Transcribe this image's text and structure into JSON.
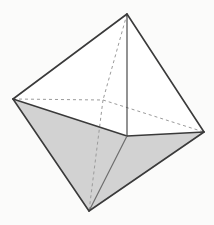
{
  "figure": {
    "name": "octahedron",
    "background_color": "#fbfbfa",
    "edge_color": "#3a3a3a",
    "hidden_edge_color": "#9b9b9b",
    "shaded_face_color": "#d2d2d2",
    "unshaded_face_color": "#ffffff",
    "edge_width": 1.6,
    "hidden_edge_width": 1.0,
    "hidden_edge_dash": "3 3",
    "vertices": {
      "top": {
        "label": "top apex",
        "x": 127,
        "y": 14
      },
      "left": {
        "label": "left vertex",
        "x": 13,
        "y": 99
      },
      "back": {
        "label": "back vertex",
        "x": 103,
        "y": 100
      },
      "right": {
        "label": "right vertex",
        "x": 204,
        "y": 132
      },
      "front": {
        "label": "front vertex",
        "x": 127,
        "y": 136
      },
      "bottom": {
        "label": "bottom apex",
        "x": 89,
        "y": 211
      }
    },
    "faces": [
      {
        "name": "upper-left-front",
        "vertices": [
          "top",
          "left",
          "front"
        ],
        "fill": "#ffffff",
        "visible": true
      },
      {
        "name": "upper-right-front",
        "vertices": [
          "top",
          "front",
          "right"
        ],
        "fill": "#ffffff",
        "visible": true
      },
      {
        "name": "upper-left-back",
        "vertices": [
          "top",
          "left",
          "back"
        ],
        "fill": "#ffffff",
        "visible": false
      },
      {
        "name": "upper-right-back",
        "vertices": [
          "top",
          "back",
          "right"
        ],
        "fill": "#ffffff",
        "visible": false
      },
      {
        "name": "lower-left-front",
        "vertices": [
          "bottom",
          "left",
          "front"
        ],
        "fill": "#d2d2d2",
        "visible": true
      },
      {
        "name": "lower-right-front",
        "vertices": [
          "bottom",
          "front",
          "right"
        ],
        "fill": "#d2d2d2",
        "visible": true
      },
      {
        "name": "lower-left-back",
        "vertices": [
          "bottom",
          "left",
          "back"
        ],
        "fill": "#d2d2d2",
        "visible": false
      },
      {
        "name": "lower-right-back",
        "vertices": [
          "bottom",
          "back",
          "right"
        ],
        "fill": "#d2d2d2",
        "visible": false
      }
    ],
    "visible_edges": [
      {
        "name": "edge-top-left",
        "from": "top",
        "to": "left"
      },
      {
        "name": "edge-top-front",
        "from": "top",
        "to": "front"
      },
      {
        "name": "edge-top-right",
        "from": "top",
        "to": "right"
      },
      {
        "name": "edge-left-front",
        "from": "left",
        "to": "front"
      },
      {
        "name": "edge-front-right",
        "from": "front",
        "to": "right"
      },
      {
        "name": "edge-left-bottom",
        "from": "left",
        "to": "bottom"
      },
      {
        "name": "edge-front-bottom",
        "from": "front",
        "to": "bottom"
      },
      {
        "name": "edge-right-bottom",
        "from": "right",
        "to": "bottom"
      }
    ],
    "hidden_edges": [
      {
        "name": "hidden-edge-left-back",
        "from": "left",
        "to": "back"
      },
      {
        "name": "hidden-edge-back-right",
        "from": "back",
        "to": "right"
      },
      {
        "name": "hidden-edge-top-back",
        "from": "top",
        "to": "back"
      },
      {
        "name": "hidden-edge-back-bottom",
        "from": "back",
        "to": "bottom"
      }
    ],
    "caption": ""
  }
}
